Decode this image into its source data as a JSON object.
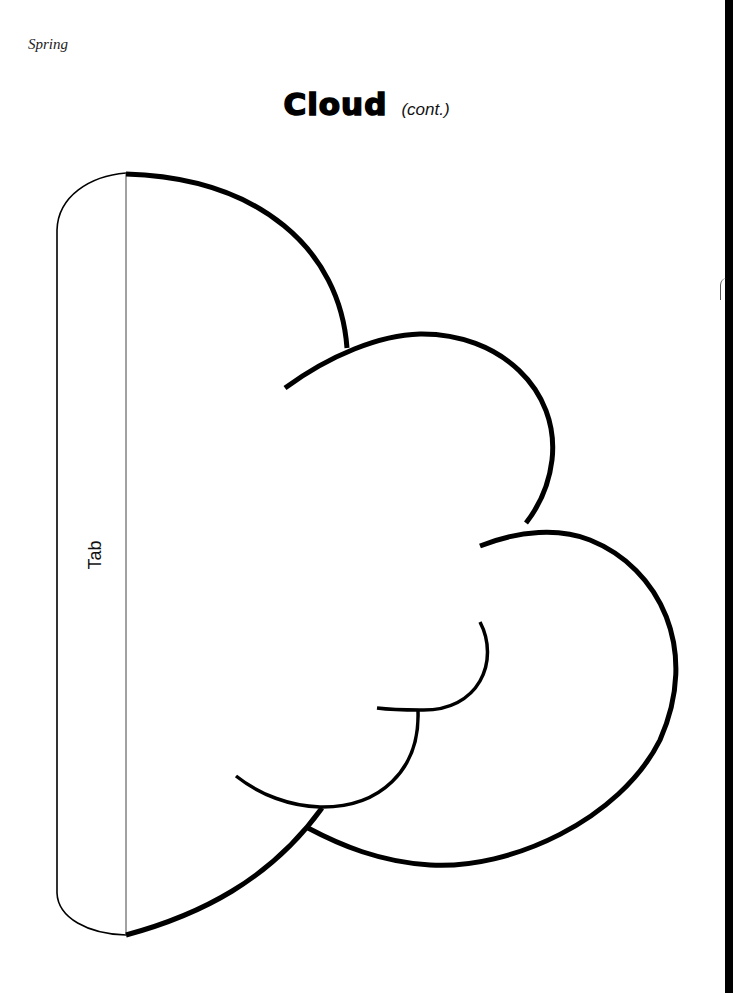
{
  "page": {
    "running_head": "Spring",
    "title": "Cloud",
    "title_suffix": "(cont.)"
  },
  "template": {
    "tab_label": "Tab",
    "parts": [
      "tab",
      "fold-line",
      "cloud-outline",
      "inner-bump-lines"
    ]
  },
  "colors": {
    "ink": "#000000",
    "paper": "#ffffff"
  }
}
